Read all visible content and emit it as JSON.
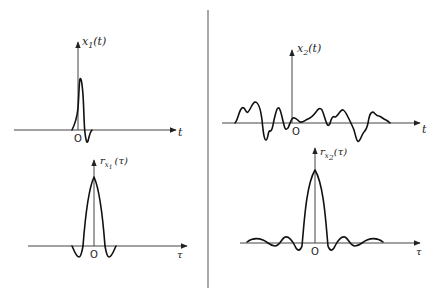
{
  "figure": {
    "panels": [
      {
        "id": "x1",
        "y_label": {
          "base": "x",
          "sub": "1",
          "arg": "(t)"
        },
        "x_label": "t",
        "origin_label": "O",
        "description": "short transient pulse"
      },
      {
        "id": "x2",
        "y_label": {
          "base": "x",
          "sub": "2",
          "arg": "(t)"
        },
        "x_label": "t",
        "origin_label": "O",
        "description": "random-like wideband signal"
      },
      {
        "id": "rx1",
        "y_label": {
          "base": "r",
          "sub": "x",
          "subsub": "1",
          "arg": "(τ)"
        },
        "x_label": "τ",
        "origin_label": "O",
        "description": "autocorrelation of x1"
      },
      {
        "id": "rx2",
        "y_label": {
          "base": "r",
          "sub": "x",
          "subsub": "2",
          "arg": "(τ)"
        },
        "x_label": "τ",
        "origin_label": "O",
        "description": "autocorrelation of x2"
      }
    ]
  }
}
